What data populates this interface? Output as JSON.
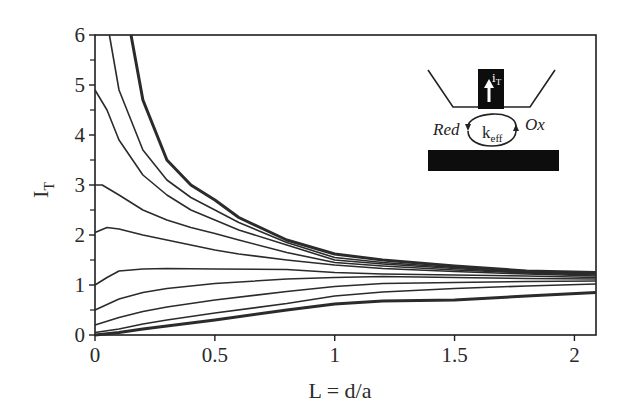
{
  "chart_data": {
    "type": "line",
    "title": "",
    "xlabel": "L = d/a",
    "ylabel": "I_T",
    "ylabel_main": "I",
    "ylabel_sub": "T",
    "xlim": [
      0,
      2.09
    ],
    "ylim": [
      0,
      6
    ],
    "xticks": [
      0,
      0.5,
      1,
      1.5,
      2
    ],
    "xtick_labels": [
      "0",
      "0.5",
      "1",
      "1.5",
      "2"
    ],
    "yticks": [
      0,
      1,
      2,
      3,
      4,
      5,
      6
    ],
    "ytick_labels": [
      "0",
      "1",
      "2",
      "3",
      "4",
      "5",
      "6"
    ],
    "grid": false,
    "legend": null,
    "series": [
      {
        "name": "upper-limit (positive feedback, thick)",
        "thick": true,
        "x": [
          0.15,
          0.2,
          0.3,
          0.4,
          0.5,
          0.6,
          0.8,
          1.0,
          1.2,
          1.5,
          1.8,
          2.09
        ],
        "y": [
          6.0,
          4.7,
          3.5,
          3.0,
          2.7,
          2.35,
          1.9,
          1.62,
          1.5,
          1.38,
          1.28,
          1.25
        ]
      },
      {
        "name": "curve-2",
        "thick": false,
        "x": [
          0.06,
          0.1,
          0.2,
          0.3,
          0.4,
          0.5,
          0.6,
          0.8,
          1.0,
          1.2,
          1.5,
          1.8,
          2.09
        ],
        "y": [
          6.0,
          4.9,
          3.7,
          3.1,
          2.75,
          2.5,
          2.25,
          1.85,
          1.55,
          1.45,
          1.35,
          1.27,
          1.23
        ]
      },
      {
        "name": "curve-3",
        "thick": false,
        "x": [
          0,
          0.05,
          0.1,
          0.2,
          0.3,
          0.4,
          0.5,
          0.6,
          0.8,
          1.0,
          1.2,
          1.5,
          1.8,
          2.09
        ],
        "y": [
          4.9,
          4.5,
          3.9,
          3.2,
          2.8,
          2.5,
          2.3,
          2.1,
          1.8,
          1.5,
          1.42,
          1.33,
          1.25,
          1.22
        ]
      },
      {
        "name": "curve-4",
        "thick": false,
        "x": [
          0,
          0.03,
          0.1,
          0.2,
          0.3,
          0.4,
          0.5,
          0.6,
          0.8,
          1.0,
          1.2,
          1.5,
          1.8,
          2.09
        ],
        "y": [
          3.0,
          3.0,
          2.8,
          2.5,
          2.3,
          2.15,
          2.03,
          1.9,
          1.65,
          1.45,
          1.38,
          1.3,
          1.24,
          1.2
        ]
      },
      {
        "name": "curve-5",
        "thick": false,
        "x": [
          0,
          0.05,
          0.1,
          0.2,
          0.3,
          0.4,
          0.5,
          0.6,
          0.8,
          1.0,
          1.2,
          1.5,
          1.8,
          2.09
        ],
        "y": [
          2.05,
          2.15,
          2.12,
          2.0,
          1.9,
          1.8,
          1.7,
          1.62,
          1.5,
          1.4,
          1.33,
          1.27,
          1.22,
          1.18
        ]
      },
      {
        "name": "curve-6 (flat)",
        "thick": false,
        "x": [
          0,
          0.05,
          0.1,
          0.2,
          0.3,
          0.5,
          0.8,
          1.0,
          1.2,
          1.5,
          1.8,
          2.09
        ],
        "y": [
          1.0,
          1.15,
          1.28,
          1.32,
          1.33,
          1.32,
          1.31,
          1.25,
          1.22,
          1.2,
          1.18,
          1.15
        ]
      },
      {
        "name": "curve-7",
        "thick": false,
        "x": [
          0,
          0.1,
          0.2,
          0.3,
          0.5,
          0.8,
          1.0,
          1.2,
          1.5,
          1.8,
          2.09
        ],
        "y": [
          0.5,
          0.72,
          0.85,
          0.93,
          1.03,
          1.12,
          1.15,
          1.17,
          1.15,
          1.13,
          1.12
        ]
      },
      {
        "name": "curve-8",
        "thick": false,
        "x": [
          0,
          0.1,
          0.2,
          0.3,
          0.5,
          0.8,
          1.0,
          1.2,
          1.5,
          1.8,
          2.09
        ],
        "y": [
          0.2,
          0.35,
          0.47,
          0.56,
          0.7,
          0.87,
          0.97,
          1.03,
          1.05,
          1.07,
          1.08
        ]
      },
      {
        "name": "curve-9",
        "thick": false,
        "x": [
          0,
          0.1,
          0.2,
          0.3,
          0.5,
          0.8,
          1.0,
          1.2,
          1.5,
          1.8,
          2.09
        ],
        "y": [
          0.05,
          0.12,
          0.22,
          0.3,
          0.44,
          0.63,
          0.78,
          0.86,
          0.93,
          0.98,
          1.02
        ]
      },
      {
        "name": "lower-limit (negative feedback, thick)",
        "thick": true,
        "x": [
          0,
          0.1,
          0.2,
          0.3,
          0.5,
          0.8,
          1.0,
          1.2,
          1.5,
          1.8,
          2.09
        ],
        "y": [
          0.0,
          0.05,
          0.12,
          0.18,
          0.3,
          0.5,
          0.62,
          0.68,
          0.7,
          0.78,
          0.85
        ]
      }
    ],
    "annotations": [
      {
        "type": "inset-diagram",
        "labels": [
          "i_T",
          "Red",
          "k_eff",
          "Ox"
        ]
      }
    ]
  },
  "inset": {
    "tip_label_main": "i",
    "tip_label_sub": "T",
    "red_label": "Red",
    "ox_label": "Ox",
    "keff_main": "k",
    "keff_sub": "eff"
  },
  "colors": {
    "line": "#2b2b2b",
    "axis": "#1e1e1e",
    "fill_black": "#0d0d0d",
    "background": "#ffffff"
  }
}
